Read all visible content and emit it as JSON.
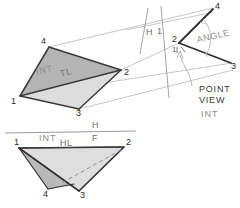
{
  "figure": {
    "kind": "hand-drawn engineering drawing",
    "background_color": "#ffffff",
    "ink_color": "#3a3a3a",
    "pencil_color": "#8d8d8d",
    "fill_dark": "#b6b6b6",
    "fill_light": "#dedede"
  },
  "views": {
    "auxiliary_view": {
      "name": "auxiliary elevation view (view 1)",
      "vertex_labels": {
        "v1": "1",
        "v2": "2",
        "v3": "3",
        "v4": "4"
      },
      "annotations": {
        "int_label": "INT",
        "tl_label": "TL"
      }
    },
    "point_view": {
      "name": "point view of line 1-2 (view 2)",
      "vertex_labels": {
        "v4": "4",
        "v2": "2",
        "v3": "3",
        "v1": "1"
      },
      "annotations": {
        "angle_label": "ANGLE",
        "callout_line1": "POINT",
        "callout_line2": "VIEW",
        "callout_line3": "INT"
      }
    },
    "fold_line_h1": {
      "name": "fold line between horizontal and auxiliary view",
      "left_label": "H",
      "right_label": "1"
    },
    "horizontal_view": {
      "name": "top (horizontal) view",
      "fold_line": {
        "upper_label": "H",
        "lower_label": "F"
      },
      "annotations": {
        "int_label": "INT",
        "hl_label": "HL"
      },
      "vertex_labels": {
        "v1": "1",
        "v2": "2",
        "v3": "3",
        "v4": "4"
      }
    }
  }
}
